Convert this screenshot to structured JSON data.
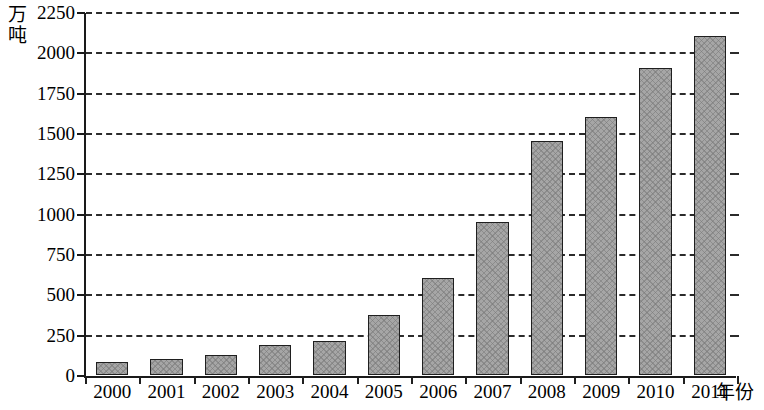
{
  "chart_data": {
    "type": "bar",
    "title": "",
    "xlabel": "年份",
    "ylabel": "万吨",
    "ylabel_lines": [
      "万",
      "吨"
    ],
    "categories": [
      "2000",
      "2001",
      "2002",
      "2003",
      "2004",
      "2005",
      "2006",
      "2007",
      "2008",
      "2009",
      "2010",
      "2011"
    ],
    "values": [
      80,
      100,
      125,
      185,
      210,
      375,
      600,
      950,
      1450,
      1600,
      1900,
      2100
    ],
    "series": [
      {
        "name": "产量",
        "values": [
          80,
          100,
          125,
          185,
          210,
          375,
          600,
          950,
          1450,
          1600,
          1900,
          2100
        ]
      }
    ],
    "ylim": [
      0,
      2250
    ],
    "ytick_step": 250,
    "yticks": [
      0,
      250,
      500,
      750,
      1000,
      1250,
      1500,
      1750,
      2000,
      2250
    ],
    "ytick_labels": [
      "0",
      "250",
      "500",
      "750",
      "1000",
      "1250",
      "1500",
      "1750",
      "2000",
      "2250"
    ],
    "grid": true,
    "grid_style": "dashed-horizontal",
    "legend": "none",
    "bar_color": "#a6a6a6",
    "bar_edge_color": "#1f1f1f",
    "axis_color": "#1a1a1a",
    "background_color": "#ffffff"
  }
}
